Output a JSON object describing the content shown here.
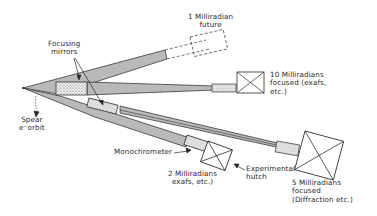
{
  "diagram": {
    "type": "beamline-layout",
    "colors": {
      "beam_fill": "#b9b9b9",
      "beam_stroke": "#3a3a3a",
      "line": "#2a2a2a",
      "background": "#ffffff"
    },
    "labels": {
      "future": [
        "1 Milliradian",
        "future"
      ],
      "ten_mrad": [
        "10 Milliradians",
        "focused (exafs,",
        "etc.)"
      ],
      "focusing_mirrors": [
        "Focusing",
        "mirrors"
      ],
      "spear": [
        "Spear",
        "e⁻orbit"
      ],
      "monochrometer": "Monochrometer",
      "two_mrad": [
        "2 Milliradians",
        "exafs, etc.)"
      ],
      "hutch": [
        "Experimental",
        "hutch"
      ],
      "five_mrad": [
        "5 Milliradians",
        "focused",
        "(Diffraction etc.)"
      ]
    },
    "components": [
      {
        "name": "source-point",
        "label": "Spear e- orbit"
      },
      {
        "name": "beamline-1mrad-future",
        "label": "1 Milliradian future",
        "style": "dashed"
      },
      {
        "name": "beamline-10mrad",
        "label": "10 Milliradians focused (exafs, etc.)"
      },
      {
        "name": "beamline-5mrad",
        "label": "5 Milliradians focused (Diffraction etc.)"
      },
      {
        "name": "beamline-2mrad",
        "label": "2 Milliradians exafs, etc.)"
      }
    ]
  }
}
